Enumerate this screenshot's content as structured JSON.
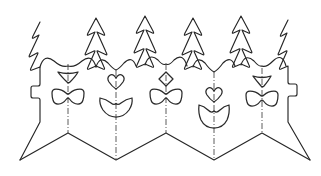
{
  "artwork": {
    "title": "Stylized fir tree border with hanging ornaments",
    "medium": "black line drawing on white",
    "width": 321,
    "height": 176,
    "stroke_color": "#262626",
    "background_color": "#ffffff",
    "centerline_color": "#4a4a4a",
    "centerline_style": "dash-dot"
  },
  "trees": [
    {
      "id": "tree-left-partial",
      "label": "left edge partial fir tree",
      "apex_x": 40,
      "apex_y": 22,
      "clipped": "left"
    },
    {
      "id": "tree-2",
      "label": "fir tree 2",
      "apex_x": 96,
      "apex_y": 18,
      "clipped": "none"
    },
    {
      "id": "tree-3",
      "label": "fir tree 3",
      "apex_x": 145,
      "apex_y": 16,
      "clipped": "none"
    },
    {
      "id": "tree-4",
      "label": "fir tree 4",
      "apex_x": 193,
      "apex_y": 18,
      "clipped": "none"
    },
    {
      "id": "tree-5",
      "label": "fir tree 5",
      "apex_x": 241,
      "apex_y": 16,
      "clipped": "none"
    },
    {
      "id": "tree-right-partial",
      "label": "right edge partial fir tree",
      "apex_x": 288,
      "apex_y": 20,
      "clipped": "right"
    }
  ],
  "swags": [
    {
      "id": "swag-1",
      "label": "garland swag between tree 1 and tree 2",
      "center_x": 68
    },
    {
      "id": "swag-2",
      "label": "garland swag between tree 2 and tree 3",
      "center_x": 116
    },
    {
      "id": "swag-3",
      "label": "garland swag between tree 3 and tree 4",
      "center_x": 166
    },
    {
      "id": "swag-4",
      "label": "garland swag between tree 4 and tree 5",
      "center_x": 214
    },
    {
      "id": "swag-5",
      "label": "garland swag between tree 5 and tree 6",
      "center_x": 262
    }
  ],
  "ornament_columns": [
    {
      "id": "column-1",
      "center_x": 68,
      "upper": {
        "shape": "inverted-triangle-cup",
        "label": "small inverted triangle bead",
        "cy": 77
      },
      "lower": {
        "shape": "bowtie",
        "label": "bowtie pendant",
        "cy": 97
      }
    },
    {
      "id": "column-2",
      "center_x": 116,
      "upper": {
        "shape": "heart",
        "label": "small heart bead",
        "cy": 81
      },
      "lower": {
        "shape": "bowl-cup",
        "label": "rounded bowl pendant",
        "cy": 105
      }
    },
    {
      "id": "column-3",
      "center_x": 166,
      "upper": {
        "shape": "diamond",
        "label": "small diamond bead",
        "cy": 79
      },
      "lower": {
        "shape": "bowtie",
        "label": "bowtie pendant",
        "cy": 97
      }
    },
    {
      "id": "column-4",
      "center_x": 214,
      "upper": {
        "shape": "heart",
        "label": "small heart bead",
        "cy": 95
      },
      "lower": {
        "shape": "notched-tulip-cup",
        "label": "notched tulip cup pendant",
        "cy": 115
      }
    },
    {
      "id": "column-5",
      "center_x": 262,
      "upper": {
        "shape": "inverted-triangle-cup",
        "label": "small inverted triangle bead",
        "cy": 81
      },
      "lower": {
        "shape": "bowtie",
        "label": "bowtie pendant",
        "cy": 99
      }
    }
  ],
  "centerlines": [
    {
      "id": "centerline-1",
      "x": 68,
      "y1": 64,
      "y2": 134
    },
    {
      "id": "centerline-2",
      "x": 116,
      "y1": 70,
      "y2": 160
    },
    {
      "id": "centerline-3",
      "x": 166,
      "y1": 64,
      "y2": 134
    },
    {
      "id": "centerline-4",
      "x": 214,
      "y1": 70,
      "y2": 160
    },
    {
      "id": "centerline-5",
      "x": 262,
      "y1": 68,
      "y2": 134
    }
  ],
  "bottom_border": {
    "label": "zigzag lower border",
    "valleys_x": [
      20,
      116,
      214,
      310
    ],
    "peaks_x": [
      68,
      166,
      262
    ],
    "valley_y": 160,
    "peak_y": 133
  }
}
